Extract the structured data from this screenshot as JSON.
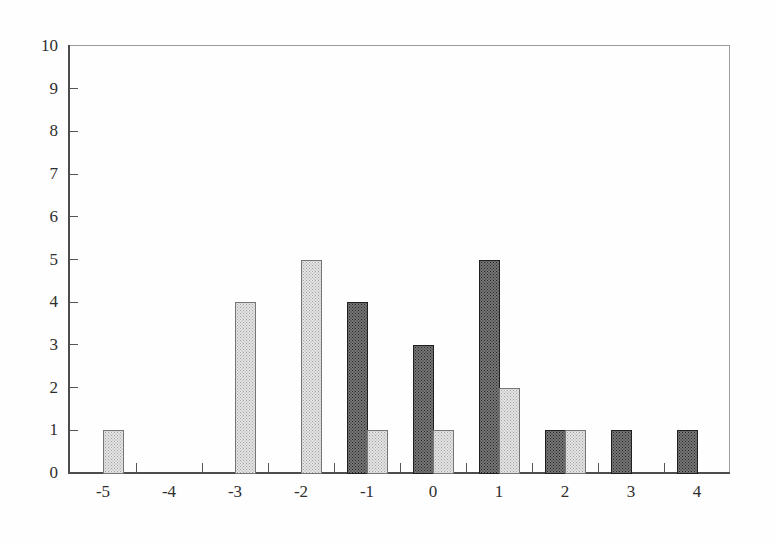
{
  "chart_data": {
    "type": "bar",
    "title": "",
    "xlabel": "",
    "ylabel": "",
    "categories": [
      -5,
      -4,
      -3,
      -2,
      -1,
      0,
      1,
      2,
      3,
      4
    ],
    "x_tick_labels": [
      "-5",
      "-4",
      "-3",
      "-2",
      "-1",
      "0",
      "1",
      "2",
      "3",
      "4"
    ],
    "series": [
      {
        "name": "dark-series",
        "slot": "left",
        "values": [
          0,
          0,
          0,
          0,
          4,
          3,
          5,
          1,
          1,
          1
        ]
      },
      {
        "name": "light-series",
        "slot": "right",
        "values": [
          1,
          0,
          4,
          5,
          1,
          1,
          2,
          1,
          0,
          0
        ]
      }
    ],
    "ylim": [
      0,
      10
    ],
    "yticks": [
      0,
      1,
      2,
      3,
      4,
      5,
      6,
      7,
      8,
      9,
      10
    ],
    "y_tick_labels": [
      "0",
      "1",
      "2",
      "3",
      "4",
      "5",
      "6",
      "7",
      "8",
      "9",
      "10"
    ],
    "grid": false,
    "legend": "none",
    "bar_width_px": 20,
    "colors": {
      "dark_bar_fill": "#565656",
      "dark_bar_border": "#1f1f1f",
      "light_bar_fill": "#c9c9c9",
      "light_bar_border": "#757575",
      "axis": "#4d4d4d",
      "frame": "#9b9b9b",
      "tick": "#555555",
      "text": "#2e2e2e",
      "background": "#fefefe"
    },
    "layout": {
      "plot_left": 70,
      "plot_top": 46,
      "plot_right": 730,
      "plot_bottom": 473,
      "category_step_px": 66,
      "first_category_center_px": 103
    }
  }
}
